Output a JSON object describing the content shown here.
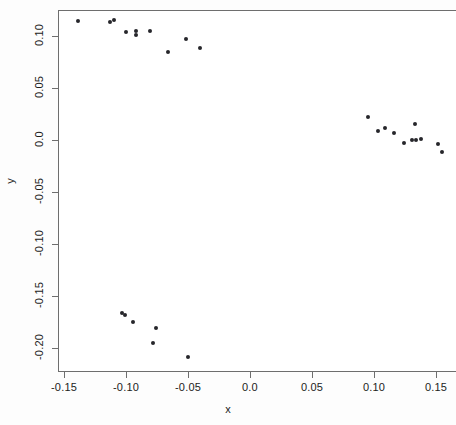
{
  "chart_data": {
    "type": "scatter",
    "title": "",
    "xlabel": "x",
    "ylabel": "y",
    "xlim": [
      -0.155,
      0.16
    ],
    "ylim": [
      -0.222,
      0.125
    ],
    "grid": false,
    "legend": null,
    "xticks": [
      -0.15,
      -0.1,
      -0.05,
      0.0,
      0.05,
      0.1,
      0.15
    ],
    "xticklabels": [
      "-0.15",
      "-0.10",
      "-0.05",
      "0.0",
      "0.05",
      "0.10",
      "0.15"
    ],
    "yticks": [
      0.1,
      0.05,
      0.0,
      -0.05,
      -0.1,
      -0.15,
      -0.2
    ],
    "yticklabels": [
      "0.10",
      "0.05",
      "0.0",
      "-0.05",
      "-0.10",
      "-0.15",
      "-0.20"
    ],
    "marker": "filled-circle",
    "marker_color": "#26262b",
    "n_points": 31,
    "points": [
      {
        "x": -0.139,
        "y": 0.114
      },
      {
        "x": -0.113,
        "y": 0.113
      },
      {
        "x": -0.11,
        "y": 0.115
      },
      {
        "x": -0.1,
        "y": 0.104
      },
      {
        "x": -0.092,
        "y": 0.105
      },
      {
        "x": -0.092,
        "y": 0.101
      },
      {
        "x": -0.081,
        "y": 0.105
      },
      {
        "x": -0.066,
        "y": 0.085
      },
      {
        "x": -0.052,
        "y": 0.097
      },
      {
        "x": -0.04,
        "y": 0.088
      },
      {
        "x": 0.095,
        "y": 0.022
      },
      {
        "x": 0.103,
        "y": 0.009
      },
      {
        "x": 0.109,
        "y": 0.012
      },
      {
        "x": 0.116,
        "y": 0.007
      },
      {
        "x": 0.124,
        "y": -0.003
      },
      {
        "x": 0.131,
        "y": 0.0
      },
      {
        "x": 0.133,
        "y": 0.015
      },
      {
        "x": 0.134,
        "y": 0.0
      },
      {
        "x": 0.138,
        "y": 0.001
      },
      {
        "x": 0.152,
        "y": -0.004
      },
      {
        "x": 0.155,
        "y": -0.012
      },
      {
        "x": -0.103,
        "y": -0.166
      },
      {
        "x": -0.101,
        "y": -0.168
      },
      {
        "x": -0.094,
        "y": -0.175
      },
      {
        "x": -0.076,
        "y": -0.181
      },
      {
        "x": -0.078,
        "y": -0.195
      },
      {
        "x": -0.05,
        "y": -0.209
      }
    ]
  },
  "axes": {
    "x_title": "x",
    "y_title": "y"
  }
}
